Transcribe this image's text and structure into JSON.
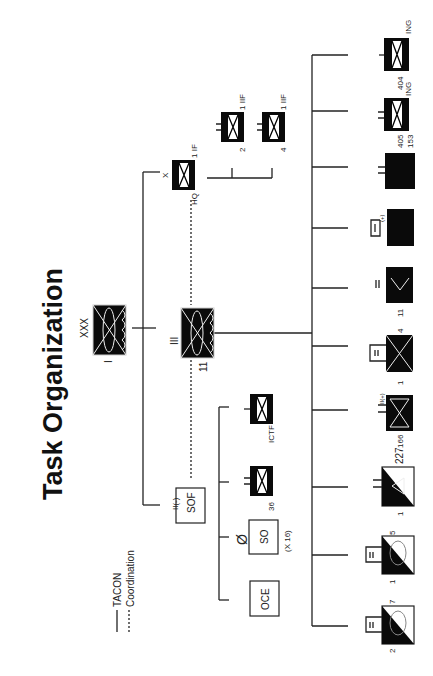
{
  "title": "Task Organization",
  "legend": {
    "solid_label": "TACON",
    "dashed_label": "Coordination"
  },
  "nodes": {
    "corps": {
      "echelon": "XXX",
      "designation": "I"
    },
    "division": {
      "echelon": "III",
      "designation": "11"
    },
    "brigade_hq": {
      "echelon": "X",
      "designation": "1 IF",
      "suffix": "HQ"
    },
    "bn_2": {
      "designation": "2",
      "higher": "1 IIF"
    },
    "bn_4": {
      "designation": "4",
      "higher": "1 IIF"
    },
    "sof": {
      "label": "SOF",
      "echelon": "II(-)"
    },
    "sof_36": {
      "designation": "36"
    },
    "sof_ictf": {
      "designation": "ICTF"
    },
    "sof_so": {
      "label": "SO",
      "echelon": "Ø",
      "count": "(X 16)"
    },
    "sof_oce": {
      "label": "OCE"
    },
    "u_ing404": {
      "designation": "404",
      "higher": "ING"
    },
    "u_405": {
      "designation": "405",
      "higher": "ING",
      "extra": "153"
    },
    "u_solid": {
      "echelon": "II"
    },
    "u_plus": {
      "echelon": "I",
      "mod": "(+)"
    },
    "u_4_11": {
      "designation": "4",
      "higher": "11",
      "echelon": "II"
    },
    "u_1_inf": {
      "designation": "1",
      "echelon": "II"
    },
    "u_166": {
      "designation": "166",
      "echelon": "II(+)"
    },
    "u_227": {
      "designation": "1",
      "higher": "227",
      "echelon": "II(+)"
    },
    "u_1_5": {
      "designation": "1",
      "higher": "5",
      "echelon": "II"
    },
    "u_2_7": {
      "designation": "2",
      "higher": "7",
      "echelon": "II"
    }
  }
}
